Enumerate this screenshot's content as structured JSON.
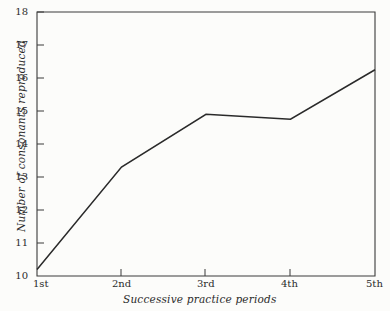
{
  "chart_data": {
    "type": "line",
    "title": "",
    "subtitle": "",
    "xlabel": "Successive practice periods",
    "ylabel": "Number of consonants reproduced",
    "categories": [
      "1st",
      "2nd",
      "3rd",
      "4th",
      "5th"
    ],
    "values": [
      10.2,
      13.3,
      14.9,
      14.75,
      16.25
    ],
    "series": [
      {
        "name": "Consonants reproduced",
        "values": [
          10.2,
          13.3,
          14.9,
          14.75,
          16.25
        ]
      }
    ],
    "ylim": [
      10,
      18
    ],
    "yticks": [
      10,
      11,
      12,
      13,
      14,
      15,
      16,
      17,
      18
    ],
    "ytick_labels": [
      "10",
      "11",
      "12",
      "13",
      "14",
      "15",
      "16",
      "17",
      "18"
    ],
    "xtick_labels": [
      "1st",
      "2nd",
      "3rd",
      "4th",
      "5th"
    ],
    "grid": false,
    "legend": false,
    "legend_position": "none",
    "annotations": [],
    "markers": false,
    "line_color": "#2a2a2a",
    "axis_color": "#3a3a3a",
    "background_color": "#fcfcfa"
  },
  "figure": {
    "plot_area": {
      "left": 37,
      "top": 12,
      "right": 375,
      "bottom": 276
    }
  }
}
